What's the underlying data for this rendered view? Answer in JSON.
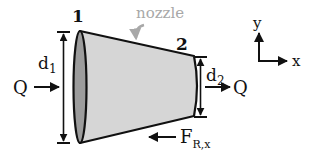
{
  "diagram": {
    "title_label": "nozzle",
    "section_labels": {
      "inlet": "1",
      "outlet": "2"
    },
    "dimensions": {
      "inlet_diameter": {
        "base": "d",
        "sub": "1"
      },
      "outlet_diameter": {
        "base": "d",
        "sub": "2"
      }
    },
    "flow": {
      "inlet_label": "Q",
      "outlet_label": "Q"
    },
    "force": {
      "base": "F",
      "sub": "R,x"
    },
    "axes": {
      "x_label": "x",
      "y_label": "y"
    },
    "colors": {
      "outline": "#111111",
      "body_fill": "#d6d6d6",
      "inlet_face_fill": "#9c9c9c",
      "annotation_gray": "#a8a8a8"
    }
  }
}
